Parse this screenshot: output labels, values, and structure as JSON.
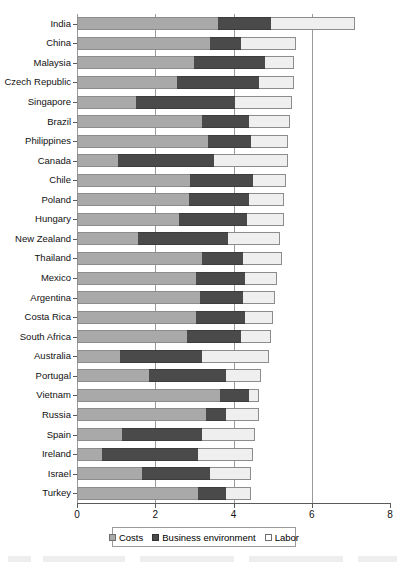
{
  "chart_data": {
    "type": "bar",
    "orientation": "horizontal",
    "stacked": true,
    "title": "",
    "xlabel": "",
    "ylabel": "",
    "xlim": [
      0,
      8
    ],
    "xticks": [
      0,
      2,
      4,
      6,
      8
    ],
    "xtick_labels": [
      "0",
      "2",
      "4",
      "6",
      "8"
    ],
    "grid": true,
    "grid_axis": "x",
    "legend_position": "bottom",
    "legend_entries": [
      "Costs",
      "Business environment",
      "Labor"
    ],
    "categories": [
      "India",
      "China",
      "Malaysia",
      "Czech Republic",
      "Singapore",
      "Brazil",
      "Philippines",
      "Canada",
      "Chile",
      "Poland",
      "Hungary",
      "New Zealand",
      "Thailand",
      "Mexico",
      "Argentina",
      "Costa Rica",
      "South Africa",
      "Australia",
      "Portugal",
      "Vietnam",
      "Russia",
      "Spain",
      "Ireland",
      "Israel",
      "Turkey"
    ],
    "series": [
      {
        "name": "Costs",
        "color": "#a9a9a9",
        "values": [
          3.6,
          3.4,
          3.0,
          2.55,
          1.5,
          3.2,
          3.35,
          1.05,
          2.9,
          2.85,
          2.6,
          1.55,
          3.2,
          3.05,
          3.15,
          3.05,
          2.8,
          1.1,
          1.85,
          3.65,
          3.3,
          1.15,
          0.65,
          1.65,
          3.1
        ]
      },
      {
        "name": "Business environment",
        "color": "#4a4a4a",
        "values": [
          1.35,
          0.8,
          1.8,
          2.1,
          2.55,
          1.2,
          1.1,
          2.45,
          1.6,
          1.55,
          1.75,
          2.3,
          1.05,
          1.25,
          1.1,
          1.25,
          1.4,
          2.1,
          1.95,
          0.75,
          0.5,
          2.05,
          2.45,
          1.75,
          0.7
        ]
      },
      {
        "name": "Labor",
        "color": "#efefef",
        "values": [
          2.15,
          1.4,
          0.75,
          0.9,
          1.45,
          1.05,
          0.95,
          1.9,
          0.85,
          0.9,
          0.95,
          1.35,
          1.0,
          0.8,
          0.8,
          0.7,
          0.75,
          1.7,
          0.9,
          0.25,
          0.85,
          1.35,
          1.4,
          1.05,
          0.65
        ]
      }
    ],
    "totals": [
      7.1,
      5.6,
      5.55,
      5.55,
      5.5,
      5.45,
      5.4,
      5.4,
      5.35,
      5.3,
      5.3,
      5.2,
      5.25,
      5.1,
      5.05,
      5.0,
      4.95,
      4.9,
      4.7,
      4.65,
      4.65,
      4.55,
      4.5,
      4.45,
      4.45
    ]
  },
  "legend": {
    "costs_label": "Costs",
    "environment_label": "Business environment",
    "labor_label": "Labor"
  }
}
